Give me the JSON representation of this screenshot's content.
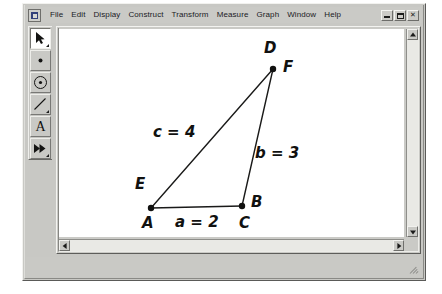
{
  "window": {
    "app_icon": "sketchpad-app-icon",
    "controls": [
      {
        "name": "minimize",
        "label": "_"
      },
      {
        "name": "restore",
        "label": "□"
      },
      {
        "name": "close",
        "label": "×"
      }
    ]
  },
  "menubar": {
    "items": [
      {
        "label": "File"
      },
      {
        "label": "Edit"
      },
      {
        "label": "Display"
      },
      {
        "label": "Construct"
      },
      {
        "label": "Transform"
      },
      {
        "label": "Measure"
      },
      {
        "label": "Graph"
      },
      {
        "label": "Window"
      },
      {
        "label": "Help"
      }
    ]
  },
  "toolbox": {
    "tools": [
      {
        "name": "selection-arrow-tool",
        "icon": "arrow-icon",
        "active": true
      },
      {
        "name": "point-tool",
        "icon": "point-icon",
        "active": false
      },
      {
        "name": "compass-circle-tool",
        "icon": "circle-icon",
        "active": false
      },
      {
        "name": "straightedge-tool",
        "icon": "line-segment-icon",
        "active": false
      },
      {
        "name": "text-label-tool",
        "icon": "text-a-icon",
        "label": "A",
        "active": false
      },
      {
        "name": "custom-tool",
        "icon": "double-arrow-icon",
        "active": false
      }
    ]
  },
  "sketch": {
    "points": [
      {
        "id": "p-left",
        "x": 92,
        "y": 179
      },
      {
        "id": "p-right",
        "x": 183,
        "y": 177
      },
      {
        "id": "p-top",
        "x": 214,
        "y": 40
      }
    ],
    "segments": [
      {
        "name": "segment-a",
        "from": "p-left",
        "to": "p-right"
      },
      {
        "name": "segment-b",
        "from": "p-right",
        "to": "p-top"
      },
      {
        "name": "segment-c",
        "from": "p-left",
        "to": "p-top"
      }
    ],
    "vertex_labels": [
      {
        "name": "label-D",
        "text": "D",
        "x": 205,
        "y": 12
      },
      {
        "name": "label-F",
        "text": "F",
        "x": 224,
        "y": 31
      },
      {
        "name": "label-E",
        "text": "E",
        "x": 76,
        "y": 148
      },
      {
        "name": "label-A",
        "text": "A",
        "x": 83,
        "y": 187
      },
      {
        "name": "label-B",
        "text": "B",
        "x": 192,
        "y": 166
      },
      {
        "name": "label-C",
        "text": "C",
        "x": 180,
        "y": 187
      }
    ],
    "measurements": [
      {
        "name": "measure-c",
        "text": "c = 4",
        "x": 94,
        "y": 96
      },
      {
        "name": "measure-b",
        "text": "b = 3",
        "x": 196,
        "y": 117
      },
      {
        "name": "measure-a",
        "text": "a = 2",
        "x": 116,
        "y": 186
      }
    ],
    "stroke_color": "#1a1a19",
    "point_color": "#111110",
    "canvas_color": "#ffffff"
  },
  "scrollbars": {
    "vertical": {
      "name": "vertical-scrollbar",
      "up": "▲",
      "down": "▼"
    },
    "horizontal": {
      "name": "horizontal-scrollbar",
      "left": "◀",
      "right": "▶"
    }
  },
  "statusbar": {
    "text": ""
  },
  "chart_data": {
    "type": "diagram",
    "vertices": [
      {
        "labels": [
          "E",
          "A"
        ],
        "x": 92,
        "y": 179
      },
      {
        "labels": [
          "B",
          "C"
        ],
        "x": 183,
        "y": 177
      },
      {
        "labels": [
          "D",
          "F"
        ],
        "x": 214,
        "y": 40
      }
    ],
    "sides": [
      {
        "label": "a",
        "value": 2,
        "display": "a = 2",
        "between": [
          "A/E",
          "B/C"
        ]
      },
      {
        "label": "b",
        "value": 3,
        "display": "b = 3",
        "between": [
          "B/C",
          "D/F"
        ]
      },
      {
        "label": "c",
        "value": 4,
        "display": "c = 4",
        "between": [
          "A/E",
          "D/F"
        ]
      }
    ]
  }
}
